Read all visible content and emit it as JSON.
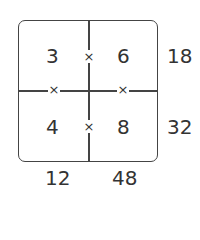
{
  "grid": {
    "cells": [
      [
        "3",
        "6"
      ],
      [
        "4",
        "8"
      ]
    ],
    "operator": "×",
    "row_products": [
      "18",
      "32"
    ],
    "column_products": [
      "12",
      "48"
    ]
  }
}
